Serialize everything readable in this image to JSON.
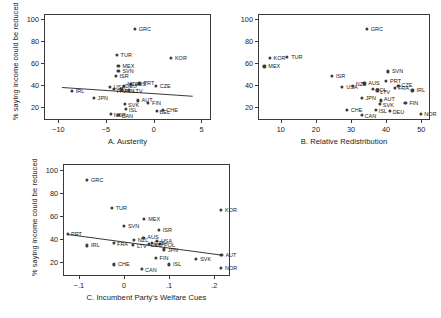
{
  "figure": {
    "ylabel": "% saying income could be reduced",
    "background": "#ffffff",
    "point_color": "#3c3c3c"
  },
  "chart_data": [
    {
      "type": "scatter",
      "title": "A. Austerity",
      "xlabel": "A. Austerity",
      "ylabel": "% saying income could be reduced",
      "xlim": [
        -11.5,
        6.0
      ],
      "ylim": [
        8,
        105
      ],
      "xticks": [
        -10,
        -5,
        0,
        5
      ],
      "xticklabels": [
        "−10",
        "−5",
        "0",
        "5"
      ],
      "yticks": [
        20,
        40,
        60,
        80,
        100
      ],
      "yticklabels": [
        "20",
        "40",
        "60",
        "80",
        "100"
      ],
      "grid": false,
      "legend": "none",
      "fit_line": {
        "x0": -9.6,
        "y0": 38.6,
        "x1": 4.1,
        "y1": 30.6
      },
      "points": [
        {
          "label": "GRC",
          "x": -2.0,
          "y": 91.0,
          "lx": 4,
          "ly": 0
        },
        {
          "label": "KOR",
          "x": 1.8,
          "y": 65.0,
          "lx": 4,
          "ly": 0
        },
        {
          "label": "TUR",
          "x": -3.9,
          "y": 67.5,
          "lx": 4,
          "ly": 0
        },
        {
          "label": "MEX",
          "x": -3.7,
          "y": 57.5,
          "lx": 4,
          "ly": 0
        },
        {
          "label": "SVN",
          "x": -3.7,
          "y": 53.0,
          "lx": 4,
          "ly": 0
        },
        {
          "label": "ISR",
          "x": -4.0,
          "y": 48.5,
          "lx": 4,
          "ly": 0
        },
        {
          "label": "PRT",
          "x": -1.5,
          "y": 41.5,
          "lx": 4,
          "ly": 0
        },
        {
          "label": "CZE",
          "x": 0.2,
          "y": 39.5,
          "lx": 4,
          "ly": 0
        },
        {
          "label": "AUS",
          "x": -2.4,
          "y": 41.0,
          "lx": 4,
          "ly": 0
        },
        {
          "label": "NZL",
          "x": -3.1,
          "y": 39.0,
          "lx": 3,
          "ly": -2
        },
        {
          "label": "USA",
          "x": -4.6,
          "y": 38.0,
          "lx": 4,
          "ly": 0
        },
        {
          "label": "FRA",
          "x": -4.2,
          "y": 36.5,
          "lx": 3,
          "ly": 2
        },
        {
          "label": "POL",
          "x": -3.4,
          "y": 36.0,
          "lx": 3,
          "ly": 2
        },
        {
          "label": "LTV",
          "x": -2.6,
          "y": 35.0,
          "lx": 4,
          "ly": 1
        },
        {
          "label": "IRL",
          "x": -8.6,
          "y": 34.5,
          "lx": 4,
          "ly": 0
        },
        {
          "label": "JPN",
          "x": -6.3,
          "y": 28.5,
          "lx": 4,
          "ly": 0
        },
        {
          "label": "AUT",
          "x": -1.7,
          "y": 26.0,
          "lx": 4,
          "ly": 0
        },
        {
          "label": "FIN",
          "x": -0.6,
          "y": 24.0,
          "lx": 4,
          "ly": 0
        },
        {
          "label": "SVK",
          "x": -3.0,
          "y": 23.0,
          "lx": 3,
          "ly": 1
        },
        {
          "label": "ISL",
          "x": -2.9,
          "y": 18.5,
          "lx": 3,
          "ly": 1
        },
        {
          "label": "BEL",
          "x": 0.3,
          "y": 16.0,
          "lx": 3,
          "ly": 1
        },
        {
          "label": "CHE",
          "x": 1.0,
          "y": 17.5,
          "lx": 3,
          "ly": 0
        },
        {
          "label": "NOR",
          "x": -4.5,
          "y": 13.5,
          "lx": 3,
          "ly": 1
        },
        {
          "label": "CAN",
          "x": -3.7,
          "y": 13.0,
          "lx": 3,
          "ly": 1
        },
        {
          "label": "DEU",
          "x": -3.3,
          "y": 36.0,
          "lx": 3,
          "ly": -3
        }
      ]
    },
    {
      "type": "scatter",
      "title": "B. Relative Redistribution",
      "xlabel": "B. Relative Redistribution",
      "ylabel": "% saying income could be reduced",
      "xlim": [
        3.5,
        52.5
      ],
      "ylim": [
        8,
        105
      ],
      "xticks": [
        10,
        20,
        30,
        40,
        50
      ],
      "xticklabels": [
        "10",
        "20",
        "30",
        "40",
        "50"
      ],
      "yticks": [
        20,
        40,
        60,
        80,
        100
      ],
      "yticklabels": [
        "20",
        "40",
        "60",
        "80",
        "100"
      ],
      "grid": false,
      "legend": "none",
      "fit_line": null,
      "points": [
        {
          "label": "GRC",
          "x": 34.5,
          "y": 91.0,
          "lx": 4,
          "ly": 0
        },
        {
          "label": "KOR",
          "x": 6.8,
          "y": 65.0,
          "lx": 4,
          "ly": 0
        },
        {
          "label": "TUR",
          "x": 11.8,
          "y": 66.0,
          "lx": 4,
          "ly": 0
        },
        {
          "label": "MEX",
          "x": 5.3,
          "y": 57.0,
          "lx": 4,
          "ly": 0
        },
        {
          "label": "SVN",
          "x": 40.5,
          "y": 52.5,
          "lx": 4,
          "ly": 0
        },
        {
          "label": "ISR",
          "x": 24.6,
          "y": 48.5,
          "lx": 4,
          "ly": 0
        },
        {
          "label": "PRT",
          "x": 40.0,
          "y": 44.0,
          "lx": 4,
          "ly": 0
        },
        {
          "label": "AUS",
          "x": 33.8,
          "y": 41.5,
          "lx": 4,
          "ly": 0
        },
        {
          "label": "USA",
          "x": 27.5,
          "y": 38.0,
          "lx": 4,
          "ly": 0
        },
        {
          "label": "NZL",
          "x": 30.5,
          "y": 39.0,
          "lx": 3,
          "ly": -2
        },
        {
          "label": "POL",
          "x": 36.2,
          "y": 36.5,
          "lx": 3,
          "ly": 1
        },
        {
          "label": "LTV",
          "x": 37.5,
          "y": 35.0,
          "lx": 3,
          "ly": 2
        },
        {
          "label": "FRA",
          "x": 42.5,
          "y": 37.5,
          "lx": 3,
          "ly": 0
        },
        {
          "label": "CZE",
          "x": 43.5,
          "y": 39.5,
          "lx": 3,
          "ly": -1
        },
        {
          "label": "IRL",
          "x": 47.5,
          "y": 35.0,
          "lx": 4,
          "ly": 0
        },
        {
          "label": "JPN",
          "x": 33.0,
          "y": 28.5,
          "lx": 4,
          "ly": 0
        },
        {
          "label": "AUT",
          "x": 38.5,
          "y": 26.0,
          "lx": 3,
          "ly": -1
        },
        {
          "label": "SVK",
          "x": 38.2,
          "y": 23.0,
          "lx": 3,
          "ly": 1
        },
        {
          "label": "FIN",
          "x": 45.5,
          "y": 24.0,
          "lx": 4,
          "ly": 0
        },
        {
          "label": "ISL",
          "x": 37.0,
          "y": 17.5,
          "lx": 3,
          "ly": 1
        },
        {
          "label": "DEU",
          "x": 41.0,
          "y": 16.5,
          "lx": 3,
          "ly": 1
        },
        {
          "label": "CHE",
          "x": 28.8,
          "y": 17.5,
          "lx": 4,
          "ly": 0
        },
        {
          "label": "CAN",
          "x": 33.0,
          "y": 12.5,
          "lx": 3,
          "ly": 1
        },
        {
          "label": "NOR",
          "x": 50.0,
          "y": 13.5,
          "lx": 3,
          "ly": 0
        }
      ]
    },
    {
      "type": "scatter",
      "title": "C. Incumbent Party's Welfare Cues",
      "xlabel": "C. Incumbent Party's Welfare Cues",
      "ylabel": "% saying income could be reduced",
      "xlim": [
        -0.135,
        0.235
      ],
      "ylim": [
        8,
        105
      ],
      "xticks": [
        -0.1,
        0,
        0.1,
        0.2
      ],
      "xticklabels": [
        "−.1",
        "0",
        ".1",
        ".2"
      ],
      "yticks": [
        20,
        40,
        60,
        80,
        100
      ],
      "yticklabels": [
        "20",
        "40",
        "60",
        "80",
        "100"
      ],
      "grid": false,
      "legend": "none",
      "fit_line": {
        "x0": -0.125,
        "y0": 44.5,
        "x1": 0.218,
        "y1": 26.5
      },
      "points": [
        {
          "label": "GRC",
          "x": -0.082,
          "y": 91.0,
          "lx": 4,
          "ly": 0
        },
        {
          "label": "KOR",
          "x": 0.215,
          "y": 65.0,
          "lx": 4,
          "ly": 0
        },
        {
          "label": "TUR",
          "x": -0.027,
          "y": 67.0,
          "lx": 4,
          "ly": 0
        },
        {
          "label": "MEX",
          "x": 0.045,
          "y": 57.5,
          "lx": 4,
          "ly": 0
        },
        {
          "label": "SVN",
          "x": 0.0,
          "y": 51.5,
          "lx": 4,
          "ly": 0
        },
        {
          "label": "ISR",
          "x": 0.077,
          "y": 48.0,
          "lx": 4,
          "ly": 0
        },
        {
          "label": "PRT",
          "x": -0.124,
          "y": 44.5,
          "lx": 3,
          "ly": 0
        },
        {
          "label": "IRL",
          "x": -0.082,
          "y": 34.5,
          "lx": 4,
          "ly": 0
        },
        {
          "label": "NZL",
          "x": 0.022,
          "y": 39.5,
          "lx": 4,
          "ly": 0
        },
        {
          "label": "AUS",
          "x": 0.043,
          "y": 41.0,
          "lx": 4,
          "ly": -1
        },
        {
          "label": "USA",
          "x": 0.073,
          "y": 38.5,
          "lx": 4,
          "ly": 0
        },
        {
          "label": "FRA",
          "x": -0.022,
          "y": 37.0,
          "lx": 3,
          "ly": 1
        },
        {
          "label": "LTV",
          "x": 0.02,
          "y": 35.0,
          "lx": 4,
          "ly": 1
        },
        {
          "label": "POL",
          "x": 0.08,
          "y": 35.5,
          "lx": 4,
          "ly": 1
        },
        {
          "label": "DEU",
          "x": 0.055,
          "y": 36.0,
          "lx": 2,
          "ly": 1
        },
        {
          "label": "CZE",
          "x": 0.062,
          "y": 36.5,
          "lx": 2,
          "ly": 0
        },
        {
          "label": "JPN",
          "x": 0.088,
          "y": 31.0,
          "lx": 4,
          "ly": 1
        },
        {
          "label": "AUT",
          "x": 0.216,
          "y": 26.0,
          "lx": 4,
          "ly": 0
        },
        {
          "label": "FIN",
          "x": 0.07,
          "y": 24.0,
          "lx": 4,
          "ly": 0
        },
        {
          "label": "SVK",
          "x": 0.16,
          "y": 23.0,
          "lx": 4,
          "ly": 0
        },
        {
          "label": "CHE",
          "x": -0.022,
          "y": 18.0,
          "lx": 4,
          "ly": 0
        },
        {
          "label": "ISL",
          "x": 0.1,
          "y": 18.0,
          "lx": 4,
          "ly": 0
        },
        {
          "label": "CAN",
          "x": 0.04,
          "y": 14.0,
          "lx": 3,
          "ly": 1
        },
        {
          "label": "NOR",
          "x": 0.215,
          "y": 15.0,
          "lx": 4,
          "ly": 0
        }
      ]
    }
  ]
}
